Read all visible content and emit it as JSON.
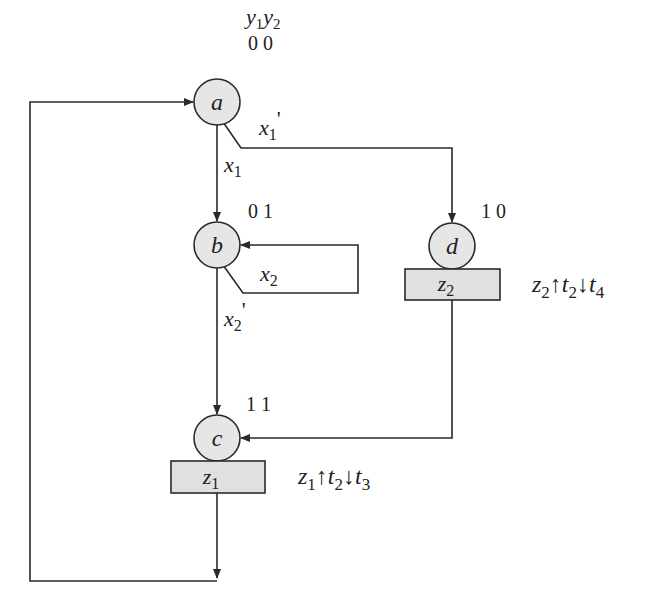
{
  "diagram": {
    "type": "asm-state-diagram",
    "state_code_header": {
      "y1": "y",
      "y1_sub": "1",
      "y2": "y",
      "y2_sub": "2"
    },
    "colors": {
      "line": "#2a2a2a",
      "state_fill": "#e6e6e6",
      "box_fill": "#e0e0e0",
      "background": "#ffffff"
    },
    "states": [
      {
        "id": "a",
        "label": "a",
        "code": "0 0"
      },
      {
        "id": "b",
        "label": "b",
        "code": "0 1"
      },
      {
        "id": "c",
        "label": "c",
        "code": "1 1"
      },
      {
        "id": "d",
        "label": "d",
        "code": "1 0"
      }
    ],
    "outputs": [
      {
        "state": "c",
        "box": {
          "v": "z",
          "sub": "1"
        },
        "annotation": {
          "z": "z",
          "zsub": "1",
          "up": "↑",
          "t": "t",
          "tsub": "2",
          "down": "↓",
          "t2": "t",
          "t2sub": "3"
        }
      },
      {
        "state": "d",
        "box": {
          "v": "z",
          "sub": "2"
        },
        "annotation": {
          "z": "z",
          "zsub": "2",
          "up": "↑",
          "t": "t",
          "tsub": "2",
          "down": "↓",
          "t2": "t",
          "t2sub": "4"
        }
      }
    ],
    "transitions": [
      {
        "from": "a",
        "to": "b",
        "label": {
          "v": "x",
          "sub": "1",
          "prime": ""
        }
      },
      {
        "from": "a",
        "to": "d",
        "label": {
          "v": "x",
          "sub": "1",
          "prime": "'"
        }
      },
      {
        "from": "b",
        "to": "b",
        "label": {
          "v": "x",
          "sub": "2",
          "prime": ""
        }
      },
      {
        "from": "b",
        "to": "c",
        "label": {
          "v": "x",
          "sub": "2",
          "prime": "'"
        }
      },
      {
        "from": "d",
        "to": "c",
        "label": null
      },
      {
        "from": "c",
        "to": "a",
        "label": null
      }
    ]
  }
}
